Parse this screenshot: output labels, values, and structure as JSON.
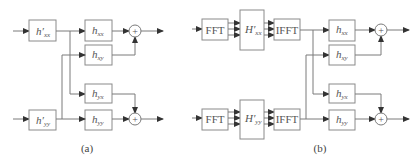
{
  "diagram": {
    "panel_a": {
      "caption": "(a)",
      "pre_filters": [
        {
          "name": "h",
          "prime": "′",
          "sub": "xx"
        },
        {
          "name": "h",
          "prime": "′",
          "sub": "yy"
        }
      ],
      "filters": [
        {
          "name": "h",
          "sub": "xx"
        },
        {
          "name": "h",
          "sub": "xy"
        },
        {
          "name": "h",
          "sub": "yx"
        },
        {
          "name": "h",
          "sub": "yy"
        }
      ],
      "summer_symbol": "+"
    },
    "panel_b": {
      "caption": "(b)",
      "fft_label": "FFT",
      "ifft_label": "IFFT",
      "freq_filters": [
        {
          "name": "H",
          "prime": "′",
          "sub": "xx"
        },
        {
          "name": "H",
          "prime": "′",
          "sub": "yy"
        }
      ],
      "filters": [
        {
          "name": "h",
          "sub": "xx"
        },
        {
          "name": "h",
          "sub": "xy"
        },
        {
          "name": "h",
          "sub": "yx"
        },
        {
          "name": "h",
          "sub": "yy"
        }
      ],
      "summer_symbol": "+"
    }
  }
}
